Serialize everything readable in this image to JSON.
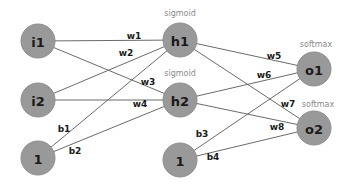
{
  "diagram": {
    "nodes": [
      {
        "id": "i1",
        "label": "i1",
        "x": 38,
        "y": 41
      },
      {
        "id": "i2",
        "label": "i2",
        "x": 38,
        "y": 100
      },
      {
        "id": "b_in",
        "label": "1",
        "x": 38,
        "y": 158
      },
      {
        "id": "h1",
        "label": "h1",
        "x": 180,
        "y": 40
      },
      {
        "id": "h2",
        "label": "h2",
        "x": 180,
        "y": 100
      },
      {
        "id": "b_hid",
        "label": "1",
        "x": 180,
        "y": 160
      },
      {
        "id": "o1",
        "label": "o1",
        "x": 314,
        "y": 69
      },
      {
        "id": "o2",
        "label": "o2",
        "x": 314,
        "y": 128
      }
    ],
    "node_radius": 17,
    "activations": [
      {
        "label": "sigmoid",
        "x": 180,
        "y": 13
      },
      {
        "label": "sigmoid",
        "x": 180,
        "y": 73
      },
      {
        "label": "softmax",
        "x": 316,
        "y": 44
      },
      {
        "label": "softmax",
        "x": 318,
        "y": 104
      }
    ],
    "edges": [
      {
        "from": "i1",
        "to": "h1",
        "label": "w1",
        "lx": 134,
        "ly": 36
      },
      {
        "from": "i2",
        "to": "h1",
        "label": "w2",
        "lx": 126,
        "ly": 53
      },
      {
        "from": "i1",
        "to": "h2",
        "label": "w3",
        "lx": 148,
        "ly": 82
      },
      {
        "from": "i2",
        "to": "h2",
        "label": "w4",
        "lx": 140,
        "ly": 104
      },
      {
        "from": "b_in",
        "to": "h1",
        "label": "b1",
        "lx": 64,
        "ly": 129
      },
      {
        "from": "b_in",
        "to": "h2",
        "label": "b2",
        "lx": 75,
        "ly": 151
      },
      {
        "from": "h1",
        "to": "o1",
        "label": "w5",
        "lx": 274,
        "ly": 56
      },
      {
        "from": "h2",
        "to": "o1",
        "label": "w6",
        "lx": 264,
        "ly": 75
      },
      {
        "from": "h1",
        "to": "o2",
        "label": "w7",
        "lx": 288,
        "ly": 104
      },
      {
        "from": "h2",
        "to": "o2",
        "label": "w8",
        "lx": 277,
        "ly": 127
      },
      {
        "from": "b_hid",
        "to": "o1",
        "label": "b3",
        "lx": 202,
        "ly": 134
      },
      {
        "from": "b_hid",
        "to": "o2",
        "label": "b4",
        "lx": 213,
        "ly": 157
      }
    ]
  }
}
